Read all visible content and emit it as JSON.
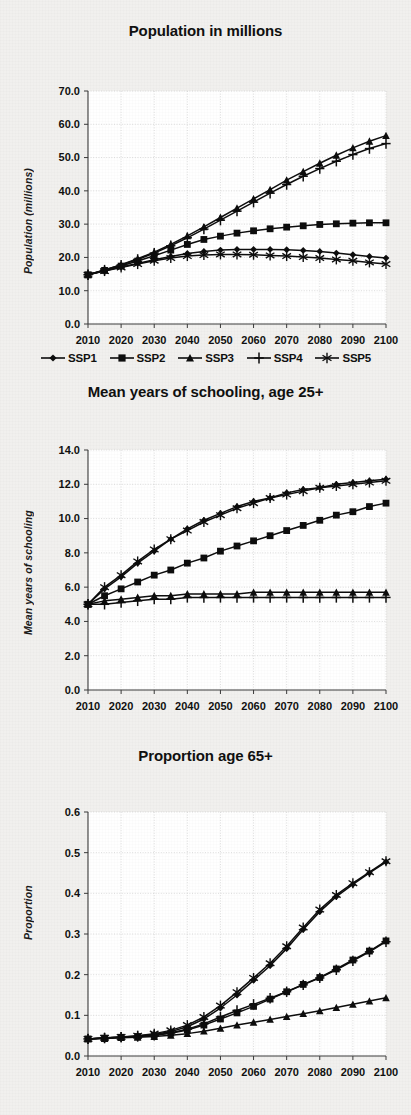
{
  "page": {
    "background_color": "#f1f0ee",
    "ink_color": "#101010"
  },
  "legend": {
    "position": "below-first-chart",
    "items": [
      {
        "label": "SSP1",
        "marker": "diamond"
      },
      {
        "label": "SSP2",
        "marker": "square"
      },
      {
        "label": "SSP3",
        "marker": "triangle"
      },
      {
        "label": "SSP4",
        "marker": "plus"
      },
      {
        "label": "SSP5",
        "marker": "asterisk"
      }
    ]
  },
  "chart_data": [
    {
      "type": "line",
      "id": "population",
      "title": "Population in millions",
      "xlabel": "",
      "ylabel": "Population (millions)",
      "x": [
        2010,
        2015,
        2020,
        2025,
        2030,
        2035,
        2040,
        2045,
        2050,
        2055,
        2060,
        2065,
        2070,
        2075,
        2080,
        2085,
        2090,
        2095,
        2100
      ],
      "xlim": [
        2010,
        2100
      ],
      "ylim": [
        0.0,
        70.0
      ],
      "xticks": [
        "2010",
        "2020",
        "2030",
        "2040",
        "2050",
        "2060",
        "2070",
        "2080",
        "2090",
        "2100"
      ],
      "yticks": [
        "0.0",
        "10.0",
        "20.0",
        "30.0",
        "40.0",
        "50.0",
        "60.0",
        "70.0"
      ],
      "grid": true,
      "series": [
        {
          "name": "SSP1",
          "marker": "diamond",
          "values": [
            14.8,
            16.0,
            17.1,
            18.2,
            19.3,
            20.3,
            21.2,
            21.8,
            22.2,
            22.4,
            22.4,
            22.4,
            22.3,
            22.1,
            21.8,
            21.3,
            20.8,
            20.3,
            19.8
          ]
        },
        {
          "name": "SSP2",
          "marker": "square",
          "values": [
            14.8,
            16.1,
            17.4,
            18.9,
            20.5,
            22.2,
            23.9,
            25.4,
            26.4,
            27.3,
            28.0,
            28.6,
            29.1,
            29.5,
            29.9,
            30.1,
            30.3,
            30.4,
            30.4
          ]
        },
        {
          "name": "SSP3",
          "marker": "triangle",
          "values": [
            14.8,
            16.2,
            17.8,
            19.6,
            21.6,
            23.9,
            26.5,
            29.2,
            32.0,
            34.8,
            37.6,
            40.4,
            43.2,
            45.8,
            48.3,
            50.7,
            52.9,
            54.9,
            56.6
          ]
        },
        {
          "name": "SSP4",
          "marker": "plus",
          "values": [
            14.8,
            16.2,
            17.7,
            19.4,
            21.3,
            23.5,
            25.9,
            28.5,
            31.2,
            33.9,
            36.6,
            39.3,
            41.9,
            44.4,
            46.7,
            48.9,
            50.9,
            52.7,
            54.2
          ]
        },
        {
          "name": "SSP5",
          "marker": "asterisk",
          "values": [
            14.8,
            15.9,
            17.0,
            18.0,
            19.0,
            19.8,
            20.4,
            20.7,
            20.9,
            20.9,
            20.8,
            20.6,
            20.4,
            20.1,
            19.8,
            19.4,
            19.0,
            18.5,
            18.0
          ]
        }
      ]
    },
    {
      "type": "line",
      "id": "schooling",
      "title": "Mean years of schooling, age 25+",
      "xlabel": "",
      "ylabel": "Mean years of schooling",
      "x": [
        2010,
        2015,
        2020,
        2025,
        2030,
        2035,
        2040,
        2045,
        2050,
        2055,
        2060,
        2065,
        2070,
        2075,
        2080,
        2085,
        2090,
        2095,
        2100
      ],
      "xlim": [
        2010,
        2100
      ],
      "ylim": [
        0.0,
        14.0
      ],
      "xticks": [
        "2010",
        "2020",
        "2030",
        "2040",
        "2050",
        "2060",
        "2070",
        "2080",
        "2090",
        "2100"
      ],
      "yticks": [
        "0.0",
        "2.0",
        "4.0",
        "6.0",
        "8.0",
        "10.0",
        "12.0",
        "14.0"
      ],
      "grid": true,
      "series": [
        {
          "name": "SSP1",
          "marker": "diamond",
          "values": [
            5.0,
            5.9,
            6.6,
            7.4,
            8.1,
            8.8,
            9.4,
            9.9,
            10.3,
            10.7,
            11.0,
            11.2,
            11.5,
            11.7,
            11.8,
            12.0,
            12.1,
            12.2,
            12.3
          ]
        },
        {
          "name": "SSP2",
          "marker": "square",
          "values": [
            5.0,
            5.5,
            5.9,
            6.3,
            6.7,
            7.0,
            7.4,
            7.7,
            8.1,
            8.4,
            8.7,
            9.0,
            9.3,
            9.6,
            9.9,
            10.2,
            10.4,
            10.7,
            10.9
          ]
        },
        {
          "name": "SSP3",
          "marker": "triangle",
          "values": [
            5.0,
            5.2,
            5.3,
            5.4,
            5.5,
            5.5,
            5.6,
            5.6,
            5.6,
            5.6,
            5.7,
            5.7,
            5.7,
            5.7,
            5.7,
            5.7,
            5.7,
            5.7,
            5.7
          ]
        },
        {
          "name": "SSP4",
          "marker": "plus",
          "values": [
            5.0,
            5.0,
            5.1,
            5.2,
            5.3,
            5.3,
            5.4,
            5.4,
            5.4,
            5.4,
            5.4,
            5.4,
            5.4,
            5.4,
            5.4,
            5.4,
            5.4,
            5.4,
            5.4
          ]
        },
        {
          "name": "SSP5",
          "marker": "asterisk",
          "values": [
            5.0,
            6.0,
            6.7,
            7.5,
            8.2,
            8.8,
            9.3,
            9.8,
            10.2,
            10.6,
            10.9,
            11.2,
            11.4,
            11.6,
            11.8,
            11.9,
            12.0,
            12.1,
            12.2
          ]
        }
      ]
    },
    {
      "type": "line",
      "id": "proportion65",
      "title": "Proportion age 65+",
      "xlabel": "",
      "ylabel": "Proportion",
      "x": [
        2010,
        2015,
        2020,
        2025,
        2030,
        2035,
        2040,
        2045,
        2050,
        2055,
        2060,
        2065,
        2070,
        2075,
        2080,
        2085,
        2090,
        2095,
        2100
      ],
      "xlim": [
        2010,
        2100
      ],
      "ylim": [
        0.0,
        0.6
      ],
      "xticks": [
        "2010",
        "2020",
        "2030",
        "2040",
        "2050",
        "2060",
        "2070",
        "2080",
        "2090",
        "2100"
      ],
      "yticks": [
        "0.0",
        "0.1",
        "0.2",
        "0.3",
        "0.4",
        "0.5",
        "0.6"
      ],
      "grid": true,
      "series": [
        {
          "name": "SSP1",
          "marker": "diamond",
          "values": [
            0.042,
            0.044,
            0.046,
            0.049,
            0.053,
            0.06,
            0.072,
            0.091,
            0.118,
            0.15,
            0.186,
            0.222,
            0.264,
            0.311,
            0.355,
            0.392,
            0.422,
            0.45,
            0.477
          ]
        },
        {
          "name": "SSP2",
          "marker": "square",
          "values": [
            0.042,
            0.044,
            0.046,
            0.048,
            0.051,
            0.056,
            0.064,
            0.076,
            0.091,
            0.106,
            0.122,
            0.14,
            0.158,
            0.176,
            0.193,
            0.214,
            0.236,
            0.258,
            0.283
          ]
        },
        {
          "name": "SSP3",
          "marker": "triangle",
          "values": [
            0.042,
            0.043,
            0.045,
            0.046,
            0.048,
            0.051,
            0.055,
            0.061,
            0.068,
            0.076,
            0.083,
            0.09,
            0.097,
            0.104,
            0.111,
            0.119,
            0.127,
            0.135,
            0.143
          ]
        },
        {
          "name": "SSP4",
          "marker": "plus",
          "values": [
            0.042,
            0.044,
            0.046,
            0.048,
            0.051,
            0.057,
            0.066,
            0.079,
            0.096,
            0.112,
            0.127,
            0.142,
            0.158,
            0.175,
            0.192,
            0.212,
            0.234,
            0.256,
            0.281
          ]
        },
        {
          "name": "SSP5",
          "marker": "asterisk",
          "values": [
            0.042,
            0.045,
            0.047,
            0.05,
            0.055,
            0.063,
            0.076,
            0.096,
            0.124,
            0.157,
            0.192,
            0.228,
            0.27,
            0.316,
            0.36,
            0.396,
            0.425,
            0.452,
            0.479
          ]
        }
      ]
    }
  ]
}
